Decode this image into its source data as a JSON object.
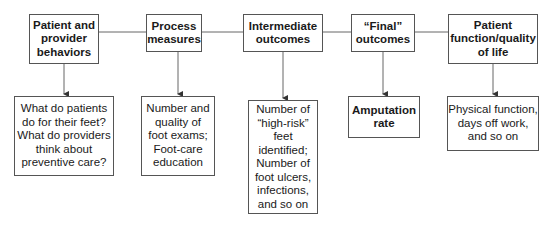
{
  "top_boxes": [
    {
      "label": "Patient and\nprovider\nbehaviors"
    },
    {
      "label": "Process\nmeasures"
    },
    {
      "label": "Intermediate\noutcomes"
    },
    {
      "label": "“Final”\noutcomes"
    },
    {
      "label": "Patient\nfunction/quality\nof life"
    }
  ],
  "bottom_boxes": [
    {
      "label": "What do patients\ndo for their feet?\nWhat do providers\nthink about\npreventive care?"
    },
    {
      "label": "Number and\nquality of\nfoot exams;\nFoot-care\neducation"
    },
    {
      "label": "Number of\n“high-risk”\nfeet\nidentified;\nNumber of\nfoot ulcers,\ninfections,\nand so on"
    },
    {
      "label": "Amputation\nrate"
    },
    {
      "label": "Physical function,\ndays off work,\nand so on"
    }
  ]
}
